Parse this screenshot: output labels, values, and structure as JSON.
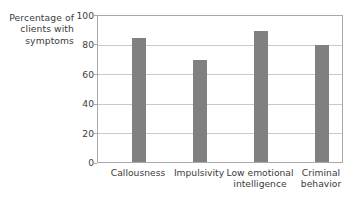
{
  "chart_data": {
    "type": "bar",
    "title": "",
    "xlabel": "",
    "ylabel": "Percentage of clients with symptoms",
    "ylabel_lines": [
      "Percentage of",
      "clients with",
      "symptoms"
    ],
    "categories": [
      "Callousness",
      "Impulsivity",
      "Low emotional intelligence",
      "Criminal behavior"
    ],
    "category_lines": [
      [
        "Callousness"
      ],
      [
        "Impulsivity"
      ],
      [
        "Low emotional",
        "intelligence"
      ],
      [
        "Criminal",
        "behavior"
      ]
    ],
    "values": [
      85,
      70,
      90,
      80
    ],
    "ylim": [
      0,
      100
    ],
    "yticks": [
      0,
      20,
      40,
      60,
      80,
      100
    ],
    "ytick_labels": [
      "0",
      "20",
      "40",
      "60",
      "80",
      "100"
    ],
    "grid": true,
    "grid_axis": "y",
    "legend": "none",
    "colors": {
      "bar": "#808080",
      "grid": "#c9c9c9",
      "axis": "#a8a8a8",
      "text": "#3b3b3b",
      "background": "#ffffff"
    }
  }
}
